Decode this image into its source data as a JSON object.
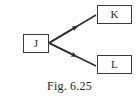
{
  "figure": {
    "caption": "Fig. 6.25",
    "background_color": "#fdfdfd",
    "stroke_color": "#2f2f2f",
    "text_color": "#2a2a2a"
  },
  "diagram": {
    "type": "node-link-diagram",
    "nodes": [
      {
        "id": "j",
        "label": "J",
        "x": 23,
        "y": 34,
        "width": 26,
        "height": 19
      },
      {
        "id": "k",
        "label": "K",
        "x": 97,
        "y": 5,
        "width": 35,
        "height": 19
      },
      {
        "id": "l",
        "label": "L",
        "x": 97,
        "y": 55,
        "width": 35,
        "height": 19
      }
    ],
    "edges": [
      {
        "id": "j-to-k",
        "from": "j",
        "to": "k",
        "direction": "forward",
        "arrowhead": "solid-triangle",
        "x1": 49,
        "y1": 43,
        "x2": 96,
        "y2": 15
      },
      {
        "id": "j-to-l",
        "from": "j",
        "to": "l",
        "direction": "forward",
        "arrowhead": "solid-triangle",
        "x1": 49,
        "y1": 43,
        "x2": 96,
        "y2": 66
      }
    ]
  }
}
